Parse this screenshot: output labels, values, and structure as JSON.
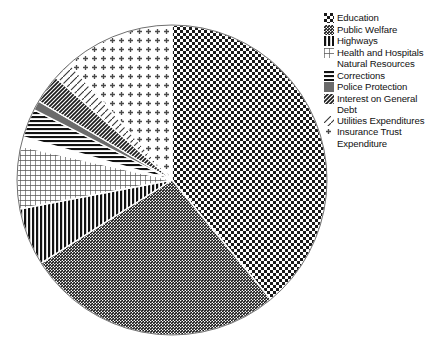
{
  "chart_data": {
    "type": "pie",
    "title": "",
    "subtitle": "",
    "xlabel": "",
    "ylabel": "",
    "legend_position": "right",
    "grid": false,
    "start_angle_deg": 0,
    "direction": "clockwise",
    "categories": [
      "Education",
      "Public Welfare",
      "Highways",
      "Health and Hospitals",
      "Natural Resources",
      "Corrections",
      "Police Protection",
      "Interest on General Debt",
      "Utilities Expenditures",
      "Insurance Trust Expenditure"
    ],
    "values": [
      39.0,
      27.0,
      6.0,
      6.5,
      1.0,
      3.0,
      1.0,
      3.0,
      2.0,
      11.5
    ],
    "slices": [
      {
        "label": "Education",
        "value": 39.0,
        "start_deg": 0.0,
        "end_deg": 140.4,
        "pattern": "checkerboard-dense-dark",
        "fill": "#2a2a2a"
      },
      {
        "label": "Public Welfare",
        "value": 27.0,
        "start_deg": 140.4,
        "end_deg": 237.6,
        "pattern": "diagonal-hatch-fine",
        "fill": "#7d7d7d"
      },
      {
        "label": "Highways",
        "value": 6.0,
        "start_deg": 237.6,
        "end_deg": 259.2,
        "pattern": "vertical-lines",
        "fill": "#1e1e1e"
      },
      {
        "label": "Health and Hospitals",
        "value": 6.5,
        "start_deg": 259.2,
        "end_deg": 282.6,
        "pattern": "grid-light",
        "fill": "#9a9a9a"
      },
      {
        "label": "Natural Resources",
        "value": 1.0,
        "start_deg": 282.6,
        "end_deg": 286.2,
        "pattern": "blank-white",
        "fill": "#ffffff"
      },
      {
        "label": "Corrections",
        "value": 3.0,
        "start_deg": 286.2,
        "end_deg": 297.0,
        "pattern": "horizontal-lines",
        "fill": "#1e1e1e"
      },
      {
        "label": "Police Protection",
        "value": 1.0,
        "start_deg": 297.0,
        "end_deg": 300.6,
        "pattern": "solid-gray",
        "fill": "#6b6b6b"
      },
      {
        "label": "Interest on General Debt",
        "value": 3.0,
        "start_deg": 300.6,
        "end_deg": 311.4,
        "pattern": "diagonal-hatch-dense",
        "fill": "#555555"
      },
      {
        "label": "Utilities Expenditures",
        "value": 2.0,
        "start_deg": 311.4,
        "end_deg": 318.6,
        "pattern": "diagonal-hatch-sparse",
        "fill": "#888888"
      },
      {
        "label": "Insurance Trust Expenditure",
        "value": 11.5,
        "start_deg": 318.6,
        "end_deg": 360.0,
        "pattern": "dot-cross-sparse",
        "fill": "#bdbdbd"
      }
    ]
  },
  "legend": {
    "items": [
      {
        "label": "Education",
        "pattern": "checkerboard-dense-dark"
      },
      {
        "label": "Public Welfare",
        "pattern": "diagonal-hatch-fine"
      },
      {
        "label": "Highways",
        "pattern": "vertical-lines"
      },
      {
        "label": "Health and Hospitals",
        "pattern": "grid-light"
      },
      {
        "label": "Natural Resources",
        "pattern": "blank-white"
      },
      {
        "label": "Corrections",
        "pattern": "horizontal-lines"
      },
      {
        "label": "Police Protection",
        "pattern": "solid-gray"
      },
      {
        "label": "Interest on General\nDebt",
        "pattern": "diagonal-hatch-dense"
      },
      {
        "label": "Utilities Expenditures",
        "pattern": "diagonal-hatch-sparse"
      },
      {
        "label": "Insurance Trust\nExpenditure",
        "pattern": "dot-cross-sparse"
      }
    ]
  },
  "colors": {
    "background": "#ffffff",
    "text": "#111111",
    "outline": "#000000"
  }
}
